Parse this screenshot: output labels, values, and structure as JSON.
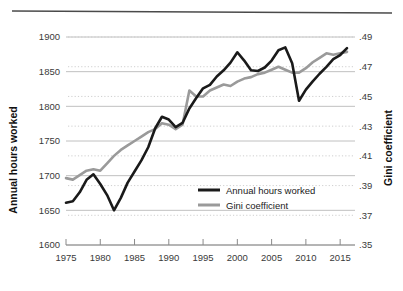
{
  "chart_data": {
    "type": "line",
    "title": "",
    "xlabel": "",
    "ylabel": "Annual hours worked",
    "y2label": "Gini coefficient",
    "grid": true,
    "legend_position": "center-right",
    "xlim": [
      1975,
      2016
    ],
    "ylim": [
      1600,
      1900
    ],
    "y2lim": [
      0.35,
      0.49
    ],
    "xticks": [
      "1975",
      "1980",
      "1985",
      "1990",
      "1995",
      "2000",
      "2005",
      "2010",
      "2015"
    ],
    "xtick_values": [
      1975,
      1980,
      1985,
      1990,
      1995,
      2000,
      2005,
      2010,
      2015
    ],
    "yticks": [
      "1600",
      "1650",
      "1700",
      "1750",
      "1800",
      "1850",
      "1900"
    ],
    "ytick_values": [
      1600,
      1650,
      1700,
      1750,
      1800,
      1850,
      1900
    ],
    "y2ticks": [
      ".35",
      ".37",
      ".39",
      ".41",
      ".43",
      ".45",
      ".47",
      ".49"
    ],
    "y2tick_values": [
      0.35,
      0.37,
      0.39,
      0.41,
      0.43,
      0.45,
      0.47,
      0.49
    ],
    "x": [
      1975,
      1976,
      1977,
      1978,
      1979,
      1980,
      1981,
      1982,
      1983,
      1984,
      1985,
      1986,
      1987,
      1988,
      1989,
      1990,
      1991,
      1992,
      1993,
      1994,
      1995,
      1996,
      1997,
      1998,
      1999,
      2000,
      2001,
      2002,
      2003,
      2004,
      2005,
      2006,
      2007,
      2008,
      2009,
      2010,
      2011,
      2012,
      2013,
      2014,
      2015,
      2016
    ],
    "series": [
      {
        "name": "Annual hours worked",
        "axis": "left",
        "color": "#1a1a1a",
        "width": 2.6,
        "values": [
          1661,
          1663,
          1676,
          1694,
          1702,
          1688,
          1672,
          1650,
          1668,
          1690,
          1706,
          1722,
          1741,
          1768,
          1785,
          1781,
          1770,
          1776,
          1797,
          1812,
          1826,
          1831,
          1843,
          1852,
          1863,
          1878,
          1866,
          1852,
          1851,
          1856,
          1866,
          1881,
          1885,
          1862,
          1808,
          1824,
          1836,
          1847,
          1857,
          1868,
          1874,
          1884
        ]
      },
      {
        "name": "Gini coefficient",
        "axis": "right",
        "color": "#9a9a9a",
        "width": 2.6,
        "values": [
          0.395,
          0.394,
          0.397,
          0.4,
          0.401,
          0.4,
          0.405,
          0.41,
          0.414,
          0.417,
          0.42,
          0.423,
          0.426,
          0.428,
          0.432,
          0.431,
          0.428,
          0.431,
          0.454,
          0.45,
          0.45,
          0.454,
          0.456,
          0.458,
          0.457,
          0.46,
          0.462,
          0.463,
          0.465,
          0.466,
          0.468,
          0.47,
          0.468,
          0.466,
          0.466,
          0.469,
          0.473,
          0.476,
          0.479,
          0.478,
          0.479,
          0.48
        ]
      }
    ]
  },
  "legend": {
    "items": [
      {
        "label": "Annual hours worked",
        "color": "#1a1a1a"
      },
      {
        "label": "Gini coefficient",
        "color": "#9a9a9a"
      }
    ]
  },
  "style": {
    "gridline_color": "#b9b9b9",
    "dotted_gridline_color": "#c9c9c9",
    "header_rule_color": "#4a4a4a",
    "axis_color": "#8a8a8a",
    "background": "#ffffff"
  }
}
